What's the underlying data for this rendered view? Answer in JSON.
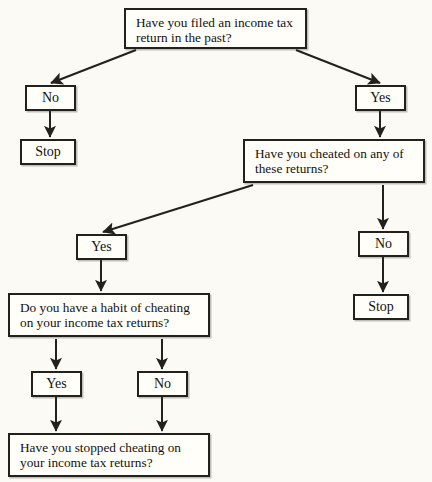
{
  "diagram": {
    "type": "flowchart",
    "background_color": "#fbfaf4",
    "box_fill_color": "#fffef9",
    "line_color": "#23211c",
    "text_color": "#14120e",
    "nodes": [
      {
        "id": "q-filed-return",
        "kind": "question",
        "text": "Have you filed an income tax return in the past?",
        "x": 124,
        "y": 8,
        "w": 183,
        "h": 41
      },
      {
        "id": "a-filed-no",
        "kind": "terminal",
        "text": "No",
        "x": 25,
        "y": 85,
        "w": 51,
        "h": 26
      },
      {
        "id": "a-filed-yes",
        "kind": "terminal",
        "text": "Yes",
        "x": 355,
        "y": 85,
        "w": 51,
        "h": 26
      },
      {
        "id": "stop-left",
        "kind": "terminal",
        "text": "Stop",
        "x": 20,
        "y": 139,
        "w": 56,
        "h": 26
      },
      {
        "id": "q-cheated",
        "kind": "question",
        "text": "Have you cheated on any of these returns?",
        "x": 243,
        "y": 139,
        "w": 182,
        "h": 44
      },
      {
        "id": "a-cheated-yes",
        "kind": "terminal",
        "text": "Yes",
        "x": 76,
        "y": 234,
        "w": 51,
        "h": 26
      },
      {
        "id": "a-cheated-no",
        "kind": "terminal",
        "text": "No",
        "x": 358,
        "y": 231,
        "w": 51,
        "h": 26
      },
      {
        "id": "stop-right",
        "kind": "terminal",
        "text": "Stop",
        "x": 353,
        "y": 294,
        "w": 56,
        "h": 26
      },
      {
        "id": "q-habit",
        "kind": "question",
        "text": "Do you have a habit of cheating on your income tax returns?",
        "x": 8,
        "y": 293,
        "w": 202,
        "h": 44
      },
      {
        "id": "a-habit-yes",
        "kind": "terminal",
        "text": "Yes",
        "x": 31,
        "y": 371,
        "w": 51,
        "h": 26
      },
      {
        "id": "a-habit-no",
        "kind": "terminal",
        "text": "No",
        "x": 137,
        "y": 371,
        "w": 51,
        "h": 26
      },
      {
        "id": "q-stopped",
        "kind": "question",
        "text": "Have you stopped cheating on your income tax returns?",
        "x": 8,
        "y": 433,
        "w": 202,
        "h": 44
      }
    ],
    "edges": [
      {
        "id": "edge-filed-to-no",
        "from": "q-filed-return",
        "to": "a-filed-no",
        "kind": "diagonal",
        "x1": 136,
        "y1": 50,
        "x2": 51,
        "y2": 83
      },
      {
        "id": "edge-filed-to-yes",
        "from": "q-filed-return",
        "to": "a-filed-yes",
        "kind": "diagonal",
        "x1": 296,
        "y1": 50,
        "x2": 380,
        "y2": 83
      },
      {
        "id": "edge-no-to-stop",
        "from": "a-filed-no",
        "to": "stop-left",
        "kind": "vertical",
        "x1": 50,
        "y1": 111,
        "x2": 50,
        "y2": 137
      },
      {
        "id": "edge-yes-to-cheated",
        "from": "a-filed-yes",
        "to": "q-cheated",
        "kind": "vertical",
        "x1": 380,
        "y1": 111,
        "x2": 380,
        "y2": 137
      },
      {
        "id": "edge-cheated-to-yes",
        "from": "q-cheated",
        "to": "a-cheated-yes",
        "kind": "diagonal",
        "x1": 253,
        "y1": 185,
        "x2": 103,
        "y2": 232
      },
      {
        "id": "edge-cheated-to-no",
        "from": "q-cheated",
        "to": "a-cheated-no",
        "kind": "vertical",
        "x1": 383,
        "y1": 185,
        "x2": 383,
        "y2": 229
      },
      {
        "id": "edge-cheatedno-to-stop",
        "from": "a-cheated-no",
        "to": "stop-right",
        "kind": "vertical",
        "x1": 383,
        "y1": 257,
        "x2": 383,
        "y2": 292
      },
      {
        "id": "edge-yes-to-habit",
        "from": "a-cheated-yes",
        "to": "q-habit",
        "kind": "vertical",
        "x1": 101,
        "y1": 260,
        "x2": 101,
        "y2": 291
      },
      {
        "id": "edge-habit-to-yes",
        "from": "q-habit",
        "to": "a-habit-yes",
        "kind": "vertical",
        "x1": 56,
        "y1": 339,
        "x2": 56,
        "y2": 369
      },
      {
        "id": "edge-habit-to-no",
        "from": "q-habit",
        "to": "a-habit-no",
        "kind": "vertical",
        "x1": 162,
        "y1": 339,
        "x2": 162,
        "y2": 369
      },
      {
        "id": "edge-habityes-to-stopped",
        "from": "a-habit-yes",
        "to": "q-stopped",
        "kind": "vertical",
        "x1": 56,
        "y1": 397,
        "x2": 56,
        "y2": 431
      },
      {
        "id": "edge-habitno-to-stopped",
        "from": "a-habit-no",
        "to": "q-stopped",
        "kind": "vertical",
        "x1": 162,
        "y1": 397,
        "x2": 162,
        "y2": 431
      }
    ]
  }
}
